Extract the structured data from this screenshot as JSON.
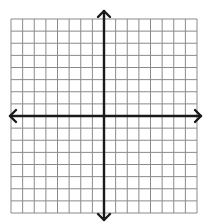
{
  "diagram": {
    "type": "coordinate-plane",
    "grid": {
      "columns": 16,
      "rows": 16,
      "x_start": 11,
      "x_end": 197,
      "y_start": 19,
      "y_end": 213,
      "line_color": "#8a8a8a",
      "line_width": 1
    },
    "axes": {
      "color": "#1a1a1a",
      "width": 2.4,
      "x_axis_row": 8,
      "y_axis_column": 8,
      "x_axis": {
        "y": 116,
        "x_from": 10,
        "x_to": 201
      },
      "y_axis": {
        "x": 104,
        "y_from": 11,
        "y_to": 220
      },
      "arrowheads": [
        "left",
        "right",
        "up",
        "down"
      ]
    },
    "labels": []
  }
}
